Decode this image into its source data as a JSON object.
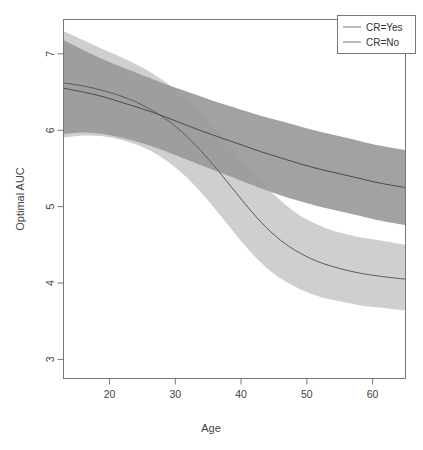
{
  "chart_data": {
    "type": "line",
    "title": "",
    "xlabel": "Age",
    "ylabel": "Optimal AUC",
    "xlim": [
      13,
      65
    ],
    "ylim": [
      2.75,
      7.45
    ],
    "xticks": [
      20,
      30,
      40,
      50,
      60
    ],
    "yticks": [
      3,
      4,
      5,
      6,
      7
    ],
    "grid": false,
    "legend_position": "top-right",
    "legend": [
      "CR=Yes",
      "CR=No"
    ],
    "x": [
      13,
      16,
      19,
      22,
      25,
      28,
      31,
      34,
      37,
      40,
      43,
      46,
      49,
      52,
      55,
      58,
      61,
      65
    ],
    "series": [
      {
        "name": "CR=Yes",
        "color": "#808080",
        "band_color": "#9a9a9a",
        "line_color": "#4a4a4a",
        "values": [
          6.55,
          6.5,
          6.44,
          6.36,
          6.28,
          6.19,
          6.09,
          5.99,
          5.9,
          5.81,
          5.72,
          5.64,
          5.56,
          5.49,
          5.43,
          5.37,
          5.31,
          5.25
        ],
        "lower": [
          5.95,
          5.97,
          5.95,
          5.9,
          5.83,
          5.74,
          5.64,
          5.54,
          5.44,
          5.34,
          5.24,
          5.15,
          5.07,
          5.0,
          4.94,
          4.88,
          4.82,
          4.76
        ],
        "upper": [
          7.18,
          7.05,
          6.93,
          6.82,
          6.72,
          6.62,
          6.53,
          6.44,
          6.35,
          6.27,
          6.19,
          6.12,
          6.05,
          5.98,
          5.92,
          5.86,
          5.8,
          5.74
        ]
      },
      {
        "name": "CR=No",
        "color": "#cfcfcf",
        "band_color": "#cfcfcf",
        "line_color": "#5a5a5a",
        "values": [
          6.62,
          6.58,
          6.52,
          6.44,
          6.33,
          6.18,
          5.98,
          5.72,
          5.42,
          5.1,
          4.8,
          4.56,
          4.39,
          4.27,
          4.19,
          4.13,
          4.09,
          4.05
        ],
        "lower": [
          5.9,
          5.93,
          5.92,
          5.87,
          5.78,
          5.64,
          5.44,
          5.18,
          4.87,
          4.55,
          4.27,
          4.06,
          3.92,
          3.82,
          3.76,
          3.71,
          3.68,
          3.64
        ],
        "upper": [
          7.3,
          7.18,
          7.06,
          6.95,
          6.82,
          6.66,
          6.46,
          6.21,
          5.93,
          5.63,
          5.34,
          5.08,
          4.88,
          4.75,
          4.66,
          4.6,
          4.56,
          4.5
        ]
      }
    ]
  },
  "axes": {
    "xlabel": "Age",
    "ylabel": "Optimal AUC",
    "xtick_labels": [
      "20",
      "30",
      "40",
      "50",
      "60"
    ],
    "ytick_labels": [
      "3",
      "4",
      "5",
      "6",
      "7"
    ]
  },
  "legend": {
    "items": [
      {
        "label": "CR=Yes",
        "swatch": "#8c8c8c"
      },
      {
        "label": "CR=No",
        "swatch": "#8c8c8c"
      }
    ]
  },
  "colors": {
    "band_cr_yes": "#919191",
    "band_cr_no": "#cdcdcd",
    "line_cr_yes": "#4f4f4f",
    "line_cr_no": "#5b5b5b",
    "axis": "#6e6e6e",
    "background": "#ffffff"
  }
}
